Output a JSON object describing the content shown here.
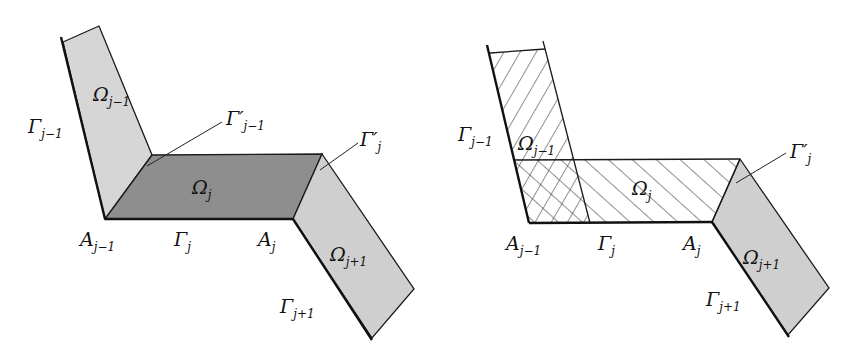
{
  "colors": {
    "light_fill": "#d4d4d4",
    "dark_fill": "#8c8c8c",
    "stroke": "#1a1a1a",
    "background": "#ffffff"
  },
  "left_figure": {
    "regions": {
      "omega_prev": {
        "main": "Ω",
        "sub": "j−1"
      },
      "omega_j": {
        "main": "Ω",
        "sub": "j"
      },
      "omega_next": {
        "main": "Ω",
        "sub": "j+1"
      }
    },
    "boundaries": {
      "gamma_prev": {
        "main": "Γ",
        "sub": "j−1"
      },
      "gamma_prev_prime": {
        "main": "Γ′",
        "sub": "j−1"
      },
      "gamma_j_prime": {
        "main": "Γ′",
        "sub": "j"
      },
      "gamma_j": {
        "main": "Γ",
        "sub": "j"
      },
      "gamma_next": {
        "main": "Γ",
        "sub": "j+1"
      }
    },
    "points": {
      "a_prev": {
        "main": "A",
        "sub": "j−1"
      },
      "a_j": {
        "main": "A",
        "sub": "j"
      }
    }
  },
  "right_figure": {
    "regions": {
      "omega_prev": {
        "main": "Ω",
        "sub": "j−1"
      },
      "omega_j": {
        "main": "Ω",
        "sub": "j"
      },
      "omega_next": {
        "main": "Ω",
        "sub": "j+1"
      }
    },
    "boundaries": {
      "gamma_prev": {
        "main": "Γ",
        "sub": "j−1"
      },
      "gamma_j_prime": {
        "main": "Γ′",
        "sub": "j"
      },
      "gamma_j": {
        "main": "Γ",
        "sub": "j"
      },
      "gamma_next": {
        "main": "Γ",
        "sub": "j+1"
      }
    },
    "points": {
      "a_prev": {
        "main": "A",
        "sub": "j−1"
      },
      "a_j": {
        "main": "A",
        "sub": "j"
      }
    }
  }
}
